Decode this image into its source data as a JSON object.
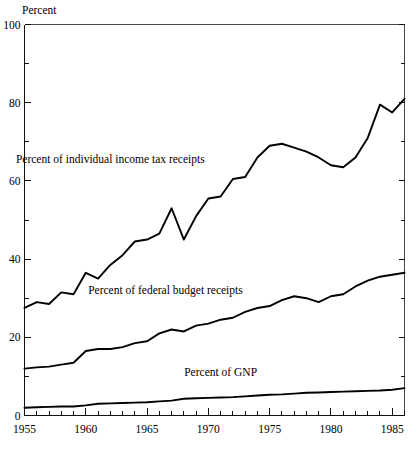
{
  "chart_data": {
    "type": "line",
    "title": "",
    "subtitle": "",
    "xlabel": "",
    "ylabel": "Percent",
    "ylabel_position": "top-left",
    "xlim": [
      1955,
      1986
    ],
    "ylim": [
      0,
      100
    ],
    "grid": false,
    "legend": "inline-annotations",
    "y_ticks_major": [
      0,
      20,
      40,
      60,
      80,
      100
    ],
    "y_ticks_minor": [
      10,
      30,
      50,
      70,
      90
    ],
    "y_tick_labels": [
      "0",
      "20",
      "40",
      "60",
      "80",
      "100"
    ],
    "x_ticks_major": [
      1955,
      1960,
      1965,
      1970,
      1975,
      1980,
      1985
    ],
    "x_tick_labels": [
      "1955",
      "1960",
      "1965",
      "1970",
      "1975",
      "1980",
      "1985"
    ],
    "x_ticks_minor_step": 1,
    "x": [
      1955,
      1956,
      1957,
      1958,
      1959,
      1960,
      1961,
      1962,
      1963,
      1964,
      1965,
      1966,
      1967,
      1968,
      1969,
      1970,
      1971,
      1972,
      1973,
      1974,
      1975,
      1976,
      1977,
      1978,
      1979,
      1980,
      1981,
      1982,
      1983,
      1984,
      1985,
      1986
    ],
    "series": [
      {
        "name": "Percent of individual income tax receipts",
        "color": "#000000",
        "label_x": 1962.0,
        "label_y": 64.5,
        "values": [
          27.5,
          29.0,
          28.5,
          31.5,
          31.0,
          36.5,
          35.0,
          38.5,
          41.0,
          44.5,
          45.0,
          46.5,
          53.0,
          45.0,
          51.0,
          55.5,
          56.0,
          60.5,
          61.0,
          66.0,
          69.0,
          69.5,
          68.5,
          67.5,
          66.0,
          64.0,
          63.5,
          66.0,
          71.0,
          79.5,
          77.5,
          81.0
        ]
      },
      {
        "name": "Percent of federal budget receipts",
        "color": "#000000",
        "label_x": 1966.5,
        "label_y": 31.0,
        "values": [
          12.0,
          12.3,
          12.5,
          13.0,
          13.5,
          16.5,
          17.0,
          17.0,
          17.5,
          18.5,
          19.0,
          21.0,
          22.0,
          21.5,
          23.0,
          23.5,
          24.5,
          25.0,
          26.5,
          27.5,
          28.0,
          29.5,
          30.5,
          30.0,
          29.0,
          30.5,
          31.0,
          33.0,
          34.5,
          35.5,
          36.0,
          36.5
        ]
      },
      {
        "name": "Percent of GNP",
        "color": "#000000",
        "label_x": 1971.0,
        "label_y": 10.0,
        "values": [
          2.0,
          2.1,
          2.2,
          2.3,
          2.3,
          2.6,
          3.0,
          3.1,
          3.2,
          3.3,
          3.4,
          3.6,
          3.8,
          4.3,
          4.4,
          4.5,
          4.6,
          4.7,
          4.9,
          5.1,
          5.3,
          5.4,
          5.6,
          5.8,
          5.9,
          6.0,
          6.1,
          6.2,
          6.3,
          6.4,
          6.6,
          7.0
        ]
      }
    ]
  }
}
